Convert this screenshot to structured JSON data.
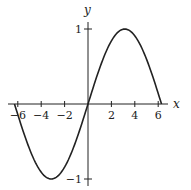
{
  "chart_data": {
    "type": "line",
    "title": "",
    "function": "y = sin(x/2)",
    "xlabel": "x",
    "ylabel": "y",
    "xlim": [
      -6.6,
      7
    ],
    "ylim": [
      -1.1,
      1.2
    ],
    "x_ticks": [
      -6,
      -4,
      -2,
      2,
      4,
      6
    ],
    "x_tick_labels": [
      "−6",
      "−4",
      "−2",
      "2",
      "4",
      "6"
    ],
    "y_ticks": [
      1,
      -1
    ],
    "y_tick_labels": [
      "1",
      "−1"
    ],
    "grid": false,
    "legend": null,
    "series": [
      {
        "name": "sin(x/2)",
        "domain": [
          -6.283,
          6.283
        ],
        "x": [
          -6.283,
          -5.498,
          -4.712,
          -3.927,
          -3.1416,
          -2.356,
          -1.571,
          -0.785,
          0,
          0.785,
          1.571,
          2.356,
          3.1416,
          3.927,
          4.712,
          5.498,
          6.283
        ],
        "y": [
          0,
          -0.383,
          -0.707,
          -0.924,
          -1,
          -0.924,
          -0.707,
          -0.383,
          0,
          0.383,
          0.707,
          0.924,
          1,
          0.924,
          0.707,
          0.383,
          0
        ]
      }
    ]
  },
  "axes": {
    "x_name": "x",
    "y_name": "y"
  }
}
